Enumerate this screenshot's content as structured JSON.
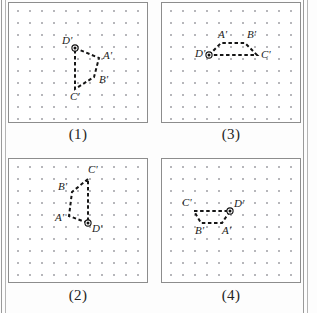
{
  "figure": {
    "panel_count": 4,
    "grid_dot_color": "#8f8f96",
    "grid_dot_spacing": 12,
    "panel_border_color": "#8d8d8d",
    "shape_stroke_color": "#151515",
    "pivot_marker_color": "#111111",
    "label_color": "#1b1b1b",
    "background_color": "#ffffff"
  },
  "panels": [
    {
      "id": "panel-1",
      "caption": "(1)",
      "position": {
        "x": 8,
        "y": 2,
        "width": 140,
        "height": 121
      },
      "caption_position": {
        "x": 8,
        "y": 127,
        "width": 140
      },
      "grid": {
        "cols": 11,
        "rows": 10,
        "spacing": 12,
        "origin_x": 9,
        "origin_y": 8
      },
      "pivot_vertex": "D'",
      "vertices": [
        {
          "label": "D'",
          "x": 66,
          "y": 45,
          "label_dx": -13,
          "label_dy": -4
        },
        {
          "label": "A'",
          "x": 90,
          "y": 55,
          "label_dx": 4,
          "label_dy": 1
        },
        {
          "label": "B'",
          "x": 85,
          "y": 74,
          "label_dx": 5,
          "label_dy": 6
        },
        {
          "label": "C'",
          "x": 66,
          "y": 86,
          "label_dx": -5,
          "label_dy": 11
        }
      ]
    },
    {
      "id": "panel-3",
      "caption": "(3)",
      "position": {
        "x": 161,
        "y": 2,
        "width": 140,
        "height": 121
      },
      "caption_position": {
        "x": 161,
        "y": 127,
        "width": 140
      },
      "grid": {
        "cols": 11,
        "rows": 10,
        "spacing": 12,
        "origin_x": 9,
        "origin_y": 8
      },
      "pivot_vertex": "D'",
      "vertices": [
        {
          "label": "D'",
          "x": 47,
          "y": 52,
          "label_dx": -14,
          "label_dy": 2
        },
        {
          "label": "A'",
          "x": 59,
          "y": 40,
          "label_dx": -3,
          "label_dy": -5
        },
        {
          "label": "B'",
          "x": 83,
          "y": 40,
          "label_dx": 2,
          "label_dy": -5
        },
        {
          "label": "C'",
          "x": 95,
          "y": 52,
          "label_dx": 4,
          "label_dy": 3
        }
      ]
    },
    {
      "id": "panel-2",
      "caption": "(2)",
      "position": {
        "x": 8,
        "y": 158,
        "width": 140,
        "height": 125
      },
      "caption_position": {
        "x": 8,
        "y": 288,
        "width": 140
      },
      "grid": {
        "cols": 11,
        "rows": 10,
        "spacing": 12,
        "origin_x": 9,
        "origin_y": 8
      },
      "pivot_vertex": "D'",
      "vertices": [
        {
          "label": "C'",
          "x": 79,
          "y": 20,
          "label_dx": 0,
          "label_dy": -6
        },
        {
          "label": "B'",
          "x": 63,
          "y": 33,
          "label_dx": -14,
          "label_dy": -2
        },
        {
          "label": "A'",
          "x": 60,
          "y": 57,
          "label_dx": -14,
          "label_dy": 5
        },
        {
          "label": "D'",
          "x": 79,
          "y": 64,
          "label_dx": 4,
          "label_dy": 9
        }
      ]
    },
    {
      "id": "panel-4",
      "caption": "(4)",
      "position": {
        "x": 161,
        "y": 158,
        "width": 140,
        "height": 125
      },
      "caption_position": {
        "x": 161,
        "y": 288,
        "width": 140
      },
      "grid": {
        "cols": 11,
        "rows": 10,
        "spacing": 12,
        "origin_x": 9,
        "origin_y": 8
      },
      "pivot_vertex": "D'",
      "vertices": [
        {
          "label": "C'",
          "x": 32,
          "y": 52,
          "label_dx": -12,
          "label_dy": -5
        },
        {
          "label": "D'",
          "x": 68,
          "y": 52,
          "label_dx": 4,
          "label_dy": -4
        },
        {
          "label": "A'",
          "x": 60,
          "y": 64,
          "label_dx": 0,
          "label_dy": 11
        },
        {
          "label": "B'",
          "x": 39,
          "y": 64,
          "label_dx": -6,
          "label_dy": 11
        }
      ]
    }
  ]
}
